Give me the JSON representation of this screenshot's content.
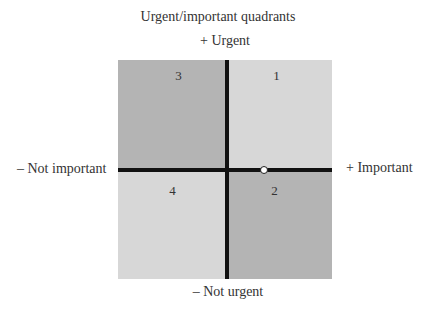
{
  "title": "Urgent/important quadrants",
  "axes": {
    "top": "+ Urgent",
    "bottom": "– Not urgent",
    "left": "– Not important",
    "right": "+ Important"
  },
  "quadrants": [
    {
      "id": "q1",
      "label": "1",
      "position": "top-right",
      "fill": "#d7d7d7"
    },
    {
      "id": "q2",
      "label": "2",
      "position": "bottom-right",
      "fill": "#b4b4b4"
    },
    {
      "id": "q3",
      "label": "3",
      "position": "top-left",
      "fill": "#b4b4b4"
    },
    {
      "id": "q4",
      "label": "4",
      "position": "bottom-left",
      "fill": "#d7d7d7"
    }
  ],
  "marker": {
    "description": "small open circle on horizontal axis in important half"
  }
}
